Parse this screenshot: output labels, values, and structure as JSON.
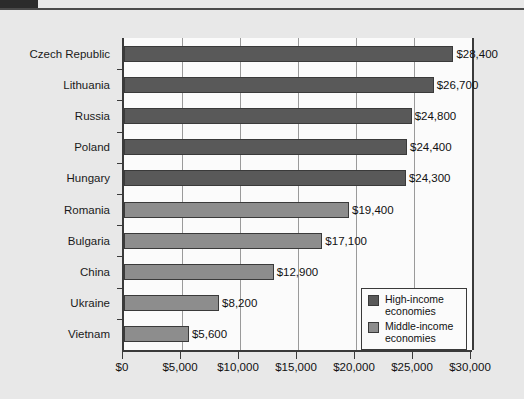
{
  "chart_data": {
    "type": "bar",
    "orientation": "horizontal",
    "title": "",
    "xlabel": "",
    "ylabel": "",
    "xlim": [
      0,
      30000
    ],
    "xticks": [
      0,
      5000,
      10000,
      15000,
      20000,
      25000,
      30000
    ],
    "xtick_labels": [
      "$0",
      "$5,000",
      "$10,000",
      "$15,000",
      "$20,000",
      "$25,000",
      "$30,000"
    ],
    "grid": true,
    "grid_axis": "x",
    "legend_position": "bottom-right",
    "categories": [
      "Czech Republic",
      "Lithuania",
      "Russia",
      "Poland",
      "Hungary",
      "Romania",
      "Bulgaria",
      "China",
      "Ukraine",
      "Vietnam"
    ],
    "values": [
      28400,
      26700,
      24800,
      24400,
      24300,
      19400,
      17100,
      12900,
      8200,
      5600
    ],
    "value_labels": [
      "$28,400",
      "$26,700",
      "$24,800",
      "$24,400",
      "$24,300",
      "$19,400",
      "$17,100",
      "$12,900",
      "$8,200",
      "$5,600"
    ],
    "groups": [
      "high",
      "high",
      "high",
      "high",
      "high",
      "mid",
      "mid",
      "mid",
      "mid",
      "mid"
    ],
    "legend": [
      {
        "key": "high",
        "label": "High-income economies",
        "color": "#595959"
      },
      {
        "key": "mid",
        "label": "Middle-income economies",
        "color": "#8d8d8d"
      }
    ]
  },
  "colors": {
    "page_background": "#e8e8e8",
    "plot_background": "#fbfbfb",
    "axis": "#3a3a3a",
    "gridline": "#9a9a9a",
    "high_income_bar": "#595959",
    "middle_income_bar": "#8d8d8d",
    "text": "#111111",
    "top_tab": "#2b2b2b"
  }
}
